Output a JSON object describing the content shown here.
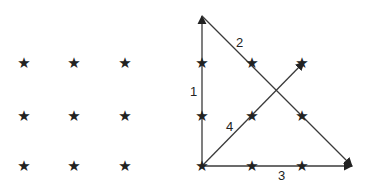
{
  "diagram": {
    "colors": {
      "ink": "#222222",
      "line": "#3a3a3a",
      "background": "#ffffff"
    },
    "star_glyph": "★",
    "left_grid": {
      "points": [
        {
          "x": 24,
          "y": 63
        },
        {
          "x": 74,
          "y": 63
        },
        {
          "x": 125,
          "y": 63
        },
        {
          "x": 24,
          "y": 116
        },
        {
          "x": 74,
          "y": 116
        },
        {
          "x": 125,
          "y": 116
        },
        {
          "x": 24,
          "y": 166
        },
        {
          "x": 74,
          "y": 166
        },
        {
          "x": 125,
          "y": 166
        }
      ]
    },
    "right_grid": {
      "points": [
        {
          "x": 202,
          "y": 63
        },
        {
          "x": 252,
          "y": 63
        },
        {
          "x": 302,
          "y": 63
        },
        {
          "x": 202,
          "y": 116
        },
        {
          "x": 252,
          "y": 116
        },
        {
          "x": 302,
          "y": 116
        },
        {
          "x": 202,
          "y": 166
        },
        {
          "x": 252,
          "y": 166
        },
        {
          "x": 302,
          "y": 166
        }
      ]
    },
    "arrows": [
      {
        "label": "1",
        "from": [
          202,
          166
        ],
        "to": [
          202,
          16
        ],
        "label_pos": [
          190,
          96
        ]
      },
      {
        "label": "2",
        "from": [
          202,
          16
        ],
        "to": [
          352,
          166
        ],
        "label_pos": [
          236,
          47
        ]
      },
      {
        "label": "3",
        "from": [
          202,
          166
        ],
        "to": [
          352,
          166
        ],
        "label_pos": [
          278,
          180
        ]
      },
      {
        "label": "4",
        "from": [
          202,
          166
        ],
        "to": [
          304,
          62
        ],
        "label_pos": [
          226,
          131
        ]
      }
    ]
  }
}
